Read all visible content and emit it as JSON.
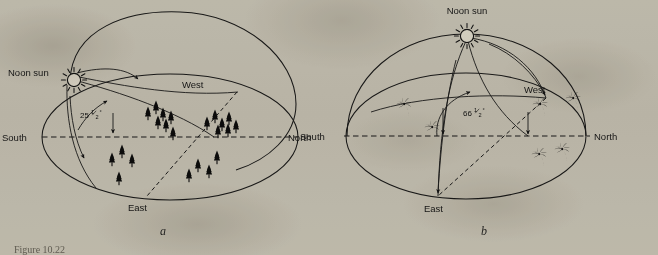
{
  "figure": {
    "caption": "Figure 10.22",
    "background_color": "#d8d5cc",
    "ink_color": "#1c1c1c"
  },
  "panels": [
    {
      "id": "a",
      "panel_label": "a",
      "sun_label": "Noon sun",
      "sun_icon": "sun-icon",
      "angle_whole": "25",
      "angle_fraction_num": "1",
      "angle_fraction_den": "2",
      "angle_degree": "°",
      "angle_text": "25½°",
      "compass": {
        "south": "South",
        "north": "North",
        "west": "West",
        "east": "East"
      },
      "vegetation": "conifer-trees",
      "vegetation_count": 22,
      "description": "High-latitude celestial sphere: low noon sun altitude of 25 1/2 degrees above the southern horizon, coniferous forest landscape."
    },
    {
      "id": "b",
      "panel_label": "b",
      "sun_label": "Noon sun",
      "sun_icon": "sun-icon",
      "angle_whole": "66",
      "angle_fraction_num": "1",
      "angle_fraction_den": "2",
      "angle_degree": "°",
      "angle_text": "66½°",
      "compass": {
        "south": "South",
        "north": "North",
        "west": "West",
        "east": "East"
      },
      "vegetation": "palm-trees",
      "vegetation_count": 8,
      "description": "Low-latitude celestial sphere: high noon sun altitude of 66 1/2 degrees above the southern horizon, palm tree landscape."
    }
  ]
}
